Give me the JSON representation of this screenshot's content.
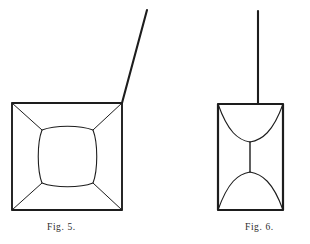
{
  "plate": {
    "background_color": "#ffffff",
    "ink_color": "#1d1d1d",
    "figures": [
      {
        "id": "fig5",
        "caption": "Fig. 5.",
        "description": "square frame with diagonals running to an inner rounded square, and a straight stem rising obliquely from the top-right corner",
        "outer_square": {
          "x": 12,
          "y": 103,
          "width": 110,
          "height": 107
        },
        "inner_rounded_square": {
          "x": 38,
          "y": 127,
          "width": 58,
          "height": 58
        },
        "stem": {
          "x1": 122,
          "y1": 103,
          "x2": 147,
          "y2": 10
        }
      },
      {
        "id": "fig6",
        "caption": "Fig. 6.",
        "description": "upright rectangle with concave arcs forming an hourglass, joined by a short vertical line, and a straight vertical stem rising from the top edge",
        "outer_rect": {
          "x": 218,
          "y": 104,
          "width": 65,
          "height": 106
        },
        "waist": {
          "x": 250,
          "y1": 142,
          "y2": 172
        },
        "stem": {
          "x1": 258,
          "y1": 104,
          "x2": 258,
          "y2": 11
        }
      }
    ]
  },
  "captions": {
    "fig5": "Fig. 5.",
    "fig6": "Fig. 6."
  }
}
